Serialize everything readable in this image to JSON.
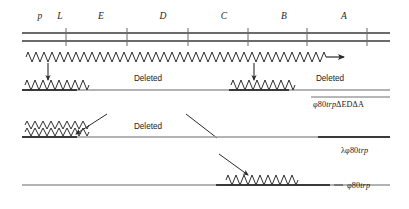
{
  "figure": {
    "gene_labels": [
      {
        "text": "p",
        "x": 40,
        "y": 11
      },
      {
        "text": "L",
        "x": 60,
        "y": 11
      },
      {
        "text": "E",
        "x": 101,
        "y": 11
      },
      {
        "text": "D",
        "x": 163,
        "y": 11
      },
      {
        "text": "C",
        "x": 224,
        "y": 11
      },
      {
        "text": "B",
        "x": 284,
        "y": 11
      },
      {
        "text": "A",
        "x": 344,
        "y": 11
      }
    ],
    "tick_positions": [
      66,
      127,
      188,
      248,
      307,
      367
    ],
    "deleted_labels": [
      {
        "text": "Deleted",
        "x": 148,
        "y": 78
      },
      {
        "text": "Deleted",
        "x": 330,
        "y": 78
      },
      {
        "text": "Deleted",
        "x": 148,
        "y": 126
      }
    ],
    "phage_labels": [
      {
        "id": "row2",
        "prefix": "φ80",
        "italic": "trp",
        "suffix": "ΔEDΔA",
        "x": 313,
        "y": 103
      },
      {
        "id": "row3",
        "prefix": "λφ80",
        "italic": "trp",
        "suffix": "",
        "x": 341,
        "y": 149
      },
      {
        "id": "row4",
        "prefix": "φ80",
        "italic": "trp",
        "suffix": "",
        "x": 344,
        "y": 186
      }
    ],
    "rows": [
      {
        "name": "reference-chromosome",
        "description": "double-line trp operon map with gene boundary ticks",
        "line_y_top": 33,
        "line_y_bottom": 41,
        "x_start": 22,
        "x_end": 390
      },
      {
        "name": "transcript-arrow",
        "description": "zigzag transcript with rightward arrowhead",
        "y": 57,
        "x_start": 26,
        "x_end": 340
      },
      {
        "name": "phi80trp-delta-ED-delta-A",
        "description": "phage genome with two retained zigzag segments and two deletions",
        "line_y": 90,
        "x_start": 22,
        "x_end": 390,
        "zigzags": [
          [
            24,
            76
          ],
          [
            230,
            287
          ]
        ]
      },
      {
        "name": "lambda-phi80trp",
        "description": "phage genome with one double zigzag segment at left",
        "line_y": 137,
        "x_start": 22,
        "x_end": 390,
        "zigzags": [
          [
            24,
            76
          ]
        ]
      },
      {
        "name": "phi80trp",
        "description": "phage genome with one zigzag segment at right of centre",
        "line_y": 185,
        "x_start": 22,
        "x_end": 390,
        "zigzags": [
          [
            218,
            290
          ]
        ]
      }
    ],
    "down_arrows": [
      {
        "x": 48,
        "y_start": 62,
        "y_end": 82
      },
      {
        "x": 254,
        "y_start": 62,
        "y_end": 82
      }
    ],
    "diagonal_arrows": [
      {
        "x1": 105,
        "y1": 116,
        "x2": 74,
        "y2": 134
      },
      {
        "x1": 186,
        "y1": 116,
        "x2": 216,
        "y2": 137
      },
      {
        "x1": 220,
        "y1": 155,
        "x2": 247,
        "y2": 174
      }
    ],
    "colors": {
      "line_dark": "#3a3a3a",
      "line_light": "#9a9a9a",
      "text": "#1a1a1a",
      "background": "#ffffff"
    }
  }
}
